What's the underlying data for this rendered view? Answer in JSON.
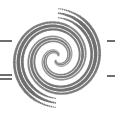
{
  "logo": {
    "name": "halftone-spiral-logo",
    "colors": {
      "background": "#ffffff",
      "dot": "#6a6a6a",
      "rule": "#6e6e6e"
    },
    "spiral": {
      "center": [
        57,
        58
      ],
      "arms": 2,
      "turns": 1.6,
      "max_radius": 45,
      "min_radius": 3,
      "max_dot_radius": 2.1
    },
    "rules": [
      {
        "side": "left",
        "x": 0,
        "y": 40,
        "width": 12
      },
      {
        "side": "left",
        "x": 0,
        "y": 74,
        "width": 12
      },
      {
        "side": "left",
        "x": 0,
        "y": 78,
        "width": 12
      },
      {
        "side": "right",
        "x": 107,
        "y": 40,
        "width": 8
      },
      {
        "side": "right",
        "x": 107,
        "y": 75,
        "width": 8
      }
    ]
  }
}
